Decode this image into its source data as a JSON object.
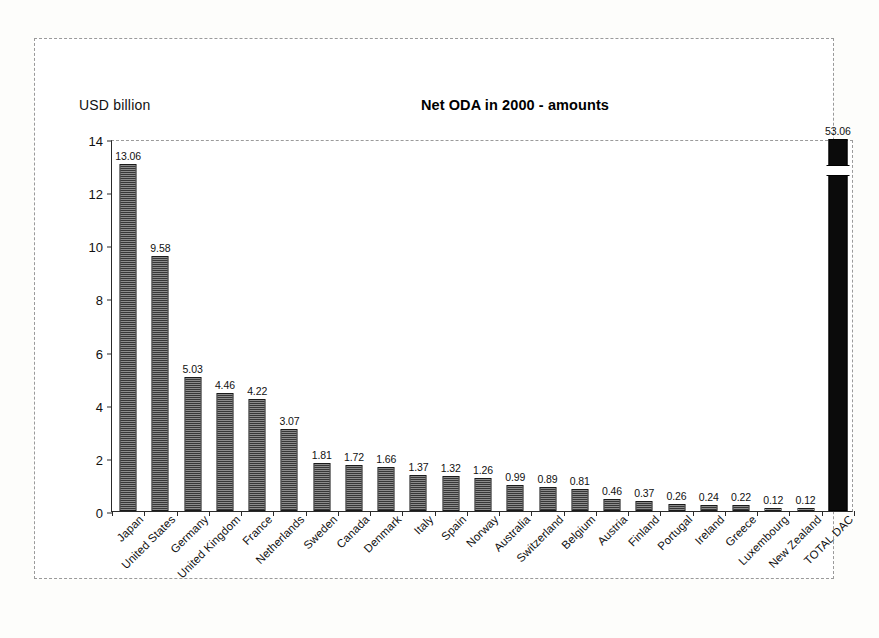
{
  "chart_data": {
    "type": "bar",
    "title": "Net ODA in 2000 - amounts",
    "ylabel": "USD billion",
    "xlabel": "",
    "ylim": [
      0,
      14
    ],
    "yticks": [
      0,
      2,
      4,
      6,
      8,
      10,
      12,
      14
    ],
    "grid": false,
    "legend": null,
    "axis_break_note": "TOTAL DAC bar is drawn with a broken axis; its true value 53.06 exceeds the 14 USD billion scale",
    "categories": [
      "Japan",
      "United States",
      "Germany",
      "United Kingdom",
      "France",
      "Netherlands",
      "Sweden",
      "Canada",
      "Denmark",
      "Italy",
      "Spain",
      "Norway",
      "Australia",
      "Switzerland",
      "Belgium",
      "Austria",
      "Finland",
      "Portugal",
      "Ireland",
      "Greece",
      "Luxembourg",
      "New Zealand",
      "TOTAL DAC"
    ],
    "values": [
      13.06,
      9.58,
      5.03,
      4.46,
      4.22,
      3.07,
      1.81,
      1.72,
      1.66,
      1.37,
      1.32,
      1.26,
      0.99,
      0.89,
      0.81,
      0.46,
      0.37,
      0.26,
      0.24,
      0.22,
      0.12,
      0.12,
      53.06
    ],
    "value_labels": [
      "13.06",
      "9.58",
      "5.03",
      "4.46",
      "4.22",
      "3.07",
      "1.81",
      "1.72",
      "1.66",
      "1.37",
      "1.32",
      "1.26",
      "0.99",
      "0.89",
      "0.81",
      "0.46",
      "0.37",
      "0.26",
      "0.24",
      "0.22",
      "0.12",
      "0.12",
      "53.06"
    ],
    "series_name": "Net ODA",
    "bar_fill_color": "#d6d6d6",
    "bar_outline_color": "#1a1a1a",
    "total_bar_color": "#0b0b0b"
  }
}
